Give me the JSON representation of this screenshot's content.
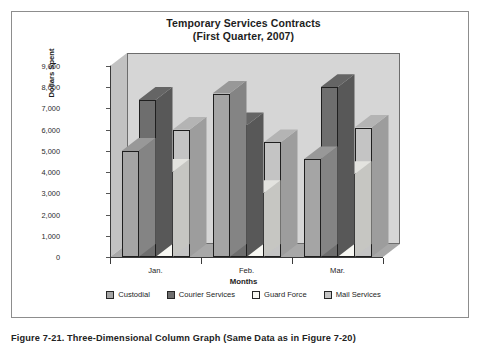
{
  "figure": {
    "caption": "Figure 7-21.   Three-Dimensional Column Graph (Same Data as in Figure 7-20)"
  },
  "chart_data": {
    "type": "bar",
    "title": "Temporary Services Contracts",
    "subtitle": "(First Quarter, 2007)",
    "xlabel": "Months",
    "ylabel": "Dollars Spent",
    "categories": [
      "Jan.",
      "Feb.",
      "Mar."
    ],
    "ylim": [
      0,
      9000
    ],
    "ytick_labels": [
      "9,000",
      "8,000",
      "7,000",
      "6,000",
      "5,000",
      "4,000",
      "3,000",
      "2,000",
      "1,000",
      "0"
    ],
    "ytick_values": [
      9000,
      8000,
      7000,
      6000,
      5000,
      4000,
      3000,
      2000,
      1000,
      0
    ],
    "grid": false,
    "legend_position": "bottom",
    "three_dimensional": true,
    "series": [
      {
        "name": "Custodial",
        "color": "#a5a5a5",
        "values": [
          5000,
          7700,
          4600
        ]
      },
      {
        "name": "Courier Services",
        "color": "#6e6e6e",
        "values": [
          7400,
          6200,
          8000
        ]
      },
      {
        "name": "Guard Force",
        "color": "#f7f7f2",
        "values": [
          4000,
          3000,
          3900
        ]
      },
      {
        "name": "Mail Services",
        "color": "#c4c4c4",
        "values": [
          6000,
          5400,
          6100
        ]
      }
    ]
  },
  "colors": {
    "plot_back_wall": "#d6d6d6",
    "plot_side_wall": "#c2c2c2",
    "plot_floor": "#a8a8a8",
    "border": "#8d8d8d",
    "text": "#1d1d1d"
  }
}
